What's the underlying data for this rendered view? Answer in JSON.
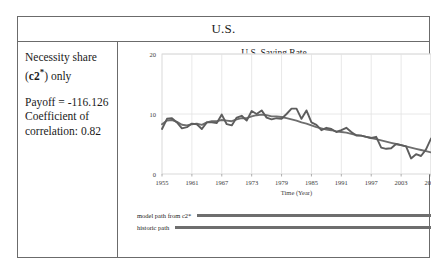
{
  "header": {
    "title": "U.S."
  },
  "left_panel": {
    "line1": "Necessity share",
    "line2_prefix": "(",
    "line2_bold": "c2",
    "line2_star": "*",
    "line2_suffix": ") only",
    "payoff": "Payoff = -116.126",
    "coef_line1": "Coefficient of",
    "coef_line2": "correlation: 0.82"
  },
  "legend": {
    "model_label": "model path from  c2*",
    "historic_label": "historic path",
    "line_color": "#6e6e6e"
  },
  "chart_data": {
    "type": "line",
    "title": "U.S. Saving Rate",
    "xlabel": "Time (Year)",
    "ylabel": "",
    "xlim": [
      1955,
      2009
    ],
    "ylim": [
      0,
      20
    ],
    "yticks": [
      0,
      10,
      20
    ],
    "xticks": [
      1955,
      1961,
      1967,
      1973,
      1979,
      1985,
      1991,
      1997,
      2003,
      2009
    ],
    "grid": true,
    "legend_position": "below-plot",
    "series": [
      {
        "name": "model path from c2*",
        "color": "#6e6e6e",
        "x": [
          1955,
          1956,
          1957,
          1958,
          1959,
          1960,
          1961,
          1962,
          1963,
          1964,
          1965,
          1966,
          1967,
          1968,
          1969,
          1970,
          1971,
          1972,
          1973,
          1974,
          1975,
          1976,
          1977,
          1978,
          1979,
          1980,
          1981,
          1982,
          1983,
          1984,
          1985,
          1986,
          1987,
          1988,
          1989,
          1990,
          1991,
          1992,
          1993,
          1994,
          1995,
          1996,
          1997,
          1998,
          1999,
          2000,
          2001,
          2002,
          2003,
          2004,
          2005,
          2006,
          2007,
          2008,
          2009
        ],
        "values": [
          8.3,
          8.9,
          9.0,
          8.7,
          8.2,
          8.1,
          8.3,
          8.4,
          8.2,
          8.6,
          8.8,
          8.8,
          9.0,
          8.9,
          8.8,
          9.1,
          9.3,
          9.3,
          9.6,
          9.8,
          9.9,
          9.8,
          9.6,
          9.6,
          9.5,
          9.3,
          9.1,
          8.9,
          8.6,
          8.4,
          8.1,
          7.8,
          7.6,
          7.4,
          7.3,
          7.1,
          7.0,
          6.9,
          6.7,
          6.5,
          6.4,
          6.2,
          6.0,
          5.8,
          5.6,
          5.4,
          5.2,
          5.0,
          4.8,
          4.6,
          4.4,
          4.2,
          4.0,
          3.8,
          3.6
        ]
      },
      {
        "name": "historic path",
        "color": "#5d5d5d",
        "x": [
          1955,
          1956,
          1957,
          1958,
          1959,
          1960,
          1961,
          1962,
          1963,
          1964,
          1965,
          1966,
          1967,
          1968,
          1969,
          1970,
          1971,
          1972,
          1973,
          1974,
          1975,
          1976,
          1977,
          1978,
          1979,
          1980,
          1981,
          1982,
          1983,
          1984,
          1985,
          1986,
          1987,
          1988,
          1989,
          1990,
          1991,
          1992,
          1993,
          1994,
          1995,
          1996,
          1997,
          1998,
          1999,
          2000,
          2001,
          2002,
          2003,
          2004,
          2005,
          2006,
          2007,
          2008,
          2009
        ],
        "values": [
          7.5,
          9.2,
          9.3,
          8.6,
          7.6,
          7.8,
          8.4,
          8.3,
          7.5,
          8.6,
          8.6,
          8.5,
          9.9,
          8.3,
          8.1,
          9.4,
          9.7,
          8.9,
          10.5,
          10.0,
          10.6,
          9.4,
          9.1,
          9.3,
          9.2,
          10.0,
          10.9,
          10.9,
          9.2,
          10.6,
          8.6,
          8.2,
          7.3,
          7.7,
          7.5,
          7.0,
          7.3,
          7.7,
          7.0,
          6.4,
          6.4,
          6.2,
          6.0,
          6.2,
          4.4,
          4.2,
          4.3,
          5.0,
          4.8,
          4.6,
          2.6,
          3.3,
          3.0,
          4.1,
          5.9
        ]
      }
    ]
  }
}
